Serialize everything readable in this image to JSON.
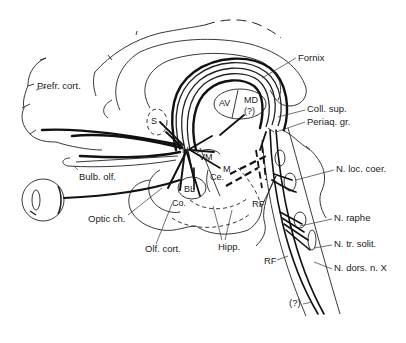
{
  "figure": {
    "labels": {
      "prefr_cort": "Prefr. cort.",
      "fornix": "Fornix",
      "coll_sup": "Coll. sup.",
      "periaq_gr": "Periaq. gr.",
      "n_loc_coer": "N. loc. coer.",
      "n_raphe": "N. raphe",
      "n_tr_solit": "N. tr. solit.",
      "n_dors_n_x": "N. dors. n. X",
      "rf_upper": "RF",
      "rf_lower": "RF",
      "unknown_bottom": "(?)",
      "hipp": "Hipp.",
      "olf_cort": "Olf. cort.",
      "optic_ch": "Optic ch.",
      "bulb_olf": "Bulb. olf.",
      "s": "S",
      "h": "H",
      "vm": "VM",
      "m": "M",
      "ce": "Ce.",
      "bl": "BL",
      "co": "Co.",
      "av": "AV",
      "md": "MD",
      "md_q": "(?)"
    }
  }
}
